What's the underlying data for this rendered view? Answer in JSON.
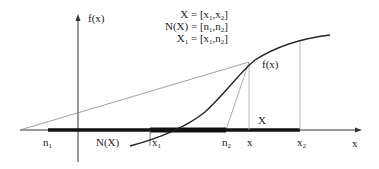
{
  "diagram": {
    "axes": {
      "y_label": "f(x)",
      "x_label": "x"
    },
    "legend": [
      {
        "lhs": "X",
        "rhs_left": "x",
        "rhs_left_sub": "1",
        "rhs_right": "x",
        "rhs_right_sub": "2"
      },
      {
        "lhs": "N(X)",
        "rhs_left": "n",
        "rhs_left_sub": "1",
        "rhs_right": "n",
        "rhs_right_sub": "2"
      },
      {
        "lhs": "X",
        "lhs_sub": "1",
        "rhs_left": "x",
        "rhs_left_sub": "1",
        "rhs_right": "n",
        "rhs_right_sub": "2"
      }
    ],
    "point_labels": {
      "fx": "f(x)",
      "X": "X",
      "NX": "N(X)",
      "n1": "n",
      "n1_sub": "1",
      "x1": "x",
      "x1_sub": "1",
      "n2": "n",
      "n2_sub": "2",
      "x": "x",
      "x2": "x",
      "x2_sub": "2"
    },
    "colors": {
      "ink": "#222222",
      "thin_line": "#888888",
      "guide": "#aaaaaa"
    }
  }
}
